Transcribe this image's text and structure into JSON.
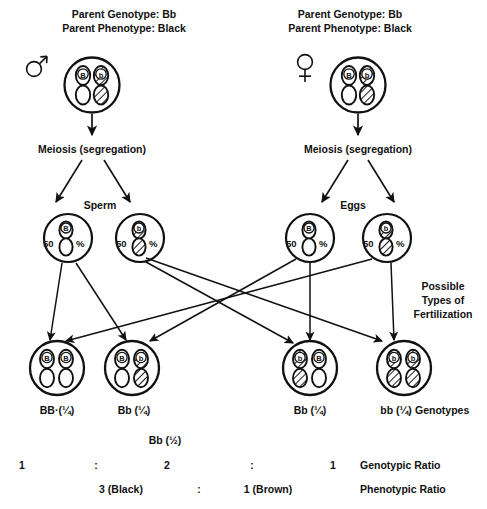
{
  "diagram": {
    "ink_color": "#111111",
    "background": "#ffffff"
  },
  "parents": [
    {
      "id": "male-parent",
      "sex_symbol": "male",
      "genotype_line": "Parent Genotype: Bb",
      "phenotype_line": "Parent Phenotype: Black",
      "chromosomes": [
        {
          "allele": "B",
          "fill": "white"
        },
        {
          "allele": "b",
          "fill": "hatched"
        }
      ],
      "meiosis_label": "Meiosis (segregation)",
      "gamete_group_label": "Sperm"
    },
    {
      "id": "female-parent",
      "sex_symbol": "female",
      "genotype_line": "Parent Genotype: Bb",
      "phenotype_line": "Parent Phenotype: Black",
      "chromosomes": [
        {
          "allele": "B",
          "fill": "white"
        },
        {
          "allele": "b",
          "fill": "hatched"
        }
      ],
      "meiosis_label": "Meiosis (segregation)",
      "gamete_group_label": "Eggs"
    }
  ],
  "gametes": [
    {
      "id": "sperm-B",
      "allele": "B",
      "fill": "white",
      "percent_value": "50",
      "percent_sign": "%"
    },
    {
      "id": "sperm-b",
      "allele": "b",
      "fill": "hatched",
      "percent_value": "50",
      "percent_sign": "%"
    },
    {
      "id": "egg-B",
      "allele": "B",
      "fill": "white",
      "percent_value": "50",
      "percent_sign": "%"
    },
    {
      "id": "egg-b",
      "allele": "b",
      "fill": "hatched",
      "percent_value": "50",
      "percent_sign": "%"
    }
  ],
  "fertilization_note": "Possible\nTypes of\nFertilization",
  "offspring": [
    {
      "id": "offspring-BB",
      "label": "BB·(¼)",
      "chromosomes": [
        {
          "allele": "B",
          "fill": "white"
        },
        {
          "allele": "B",
          "fill": "white"
        }
      ]
    },
    {
      "id": "offspring-Bb-1",
      "label": "Bb (¼)",
      "chromosomes": [
        {
          "allele": "B",
          "fill": "white"
        },
        {
          "allele": "b",
          "fill": "hatched"
        }
      ]
    },
    {
      "id": "offspring-Bb-2",
      "label": "Bb (¼)",
      "chromosomes": [
        {
          "allele": "b",
          "fill": "hatched"
        },
        {
          "allele": "B",
          "fill": "white"
        }
      ]
    },
    {
      "id": "offspring-bb",
      "label": "bb (¼)",
      "chromosomes": [
        {
          "allele": "b",
          "fill": "hatched"
        },
        {
          "allele": "b",
          "fill": "hatched"
        }
      ]
    }
  ],
  "offspring_row_caption": "Genotypes",
  "summary": {
    "heterozygote_combined": "Bb (½)",
    "genotypic": {
      "v1": "1",
      "sep1": ":",
      "v2": "2",
      "sep2": ":",
      "v3": "1",
      "name": "Genotypic Ratio"
    },
    "phenotypic": {
      "v1": "3 (Black)",
      "sep1": ":",
      "v2": "1 (Brown)",
      "name": "Phenotypic Ratio"
    }
  }
}
